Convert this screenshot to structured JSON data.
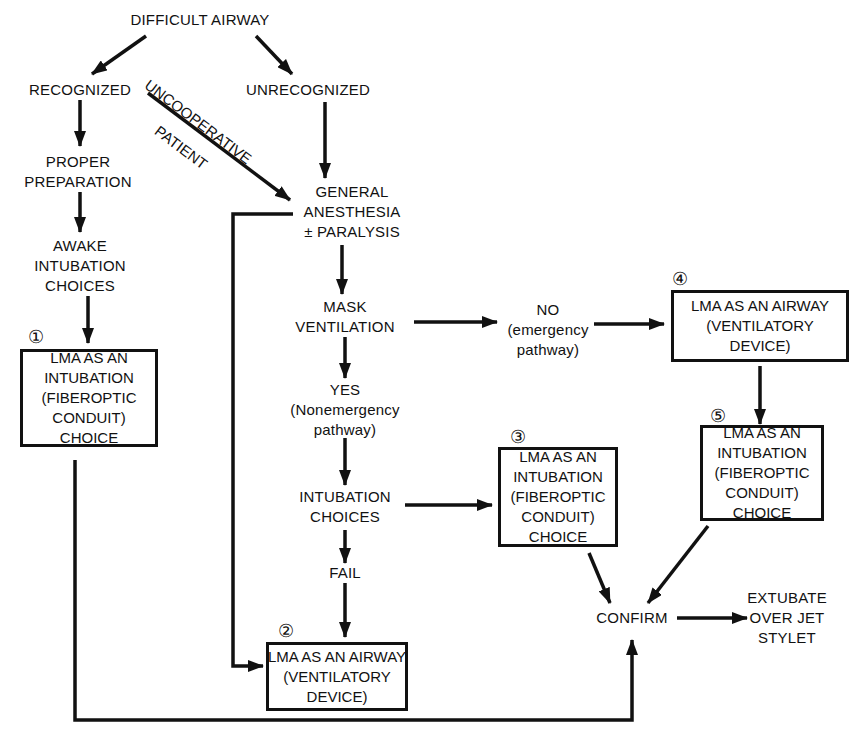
{
  "diagram": {
    "title": "DIFFICULT AIRWAY",
    "nodes": {
      "recognized": "RECOGNIZED",
      "unrecognized": "UNRECOGNIZED",
      "proper_preparation": "PROPER\nPREPARATION",
      "awake_intubation": "AWAKE\nINTUBATION\nCHOICES",
      "general_anesthesia": "GENERAL\nANESTHESIA\n± PARALYSIS",
      "mask_ventilation": "MASK\nVENTILATION",
      "yes": "YES\n(Nonemergency\npathway)",
      "no": "NO\n(emergency\npathway)",
      "intubation_choices": "INTUBATION\nCHOICES",
      "fail": "FAIL",
      "confirm": "CONFIRM",
      "extubate": "EXTUBATE\nOVER JET\nSTYLET"
    },
    "edge_labels": {
      "uncooperative": "UNCOOPERATIVE",
      "patient": "PATIENT"
    },
    "boxes": [
      {
        "number": "①",
        "text": "LMA AS AN\nINTUBATION\n(FIBEROPTIC\nCONDUIT)\nCHOICE"
      },
      {
        "number": "②",
        "text": "LMA AS AN AIRWAY\n(VENTILATORY\nDEVICE)"
      },
      {
        "number": "③",
        "text": "LMA AS AN\nINTUBATION\n(FIBEROPTIC\nCONDUIT)\nCHOICE"
      },
      {
        "number": "④",
        "text": "LMA AS AN AIRWAY\n(VENTILATORY\nDEVICE)"
      },
      {
        "number": "⑤",
        "text": "LMA AS AN\nINTUBATION\n(FIBEROPTIC\nCONDUIT)\nCHOICE"
      }
    ]
  }
}
